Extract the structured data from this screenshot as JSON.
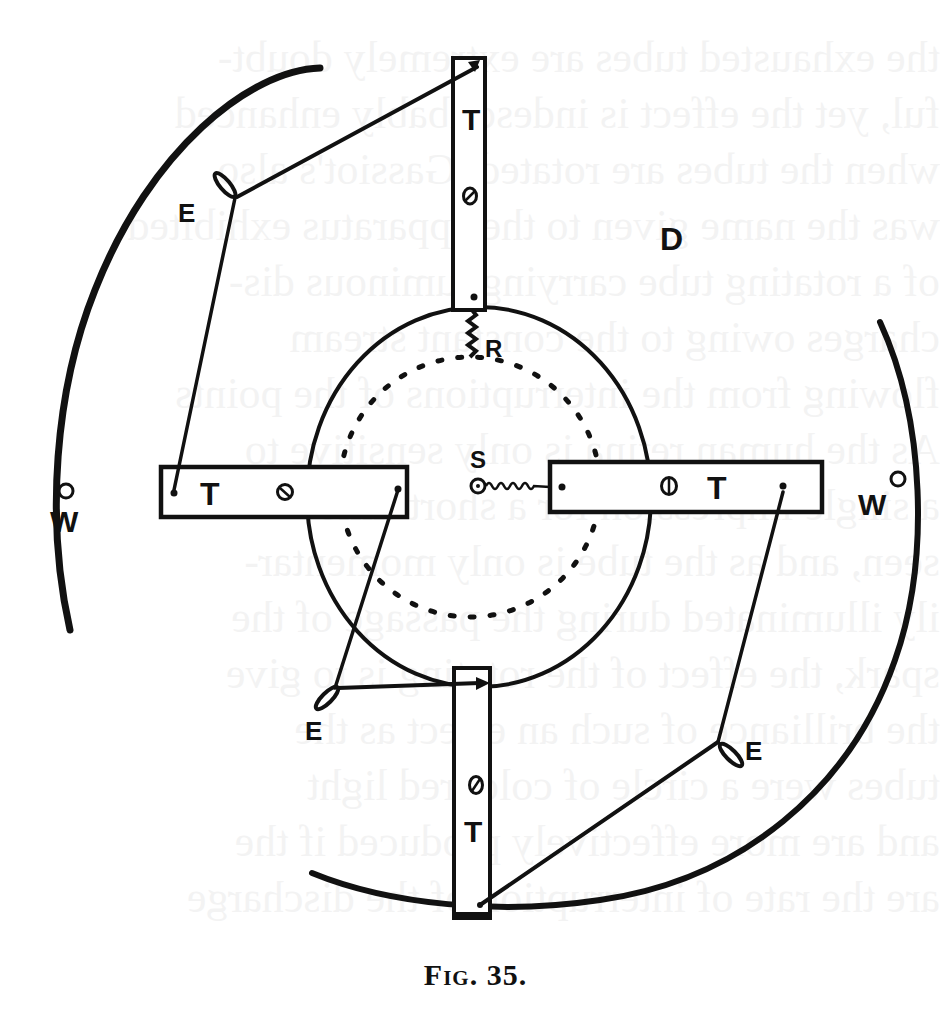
{
  "figure": {
    "caption": "Fig. 35.",
    "caption_prefix": "Fig.",
    "caption_number": "35.",
    "labels": {
      "tube_top": "T",
      "tube_left": "T",
      "tube_right": "T",
      "tube_bottom": "T",
      "disc": "D",
      "resistance": "R",
      "spring": "S",
      "weight_left": "W",
      "weight_right": "W",
      "electrode_top_left": "E",
      "electrode_bottom_left": "E",
      "electrode_bottom_right": "E"
    },
    "colors": {
      "ink": "#111111",
      "paper": "#ffffff"
    }
  },
  "bleed_through_text": [
    "the exhausted tubes are extremely doubt-",
    "ful, yet the effect is indescribably enhanced",
    "when the tubes are rotated. Gassiot's also",
    "was the name given to the apparatus exhibited",
    "of a rotating tube carrying luminous dis-",
    "charges owing to the constant stream",
    "flowing from the interruptions of the points",
    "As the human retina is only sensitive to",
    "a single impression for a short time",
    "seen, and as the tube is only momentar-",
    "ily illuminated during the passage of the",
    "spark, the effect of the rotating is to give",
    "the brilliance of such an effect as the",
    "tubes were a circle of coloured light",
    "and are more effectively produced if the",
    "are the rate of interruption of the discharge"
  ]
}
